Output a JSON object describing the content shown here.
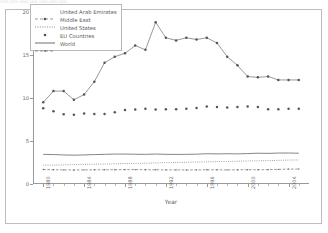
{
  "figure": {
    "ghost_text": "      1970      1975      1980      1985      1990      1995      2000"
  },
  "axes": {
    "xlabel": "Year",
    "ylabel": "Energy Consumption (TOE/Capita)",
    "yticks": [
      "0",
      "5",
      "10",
      "15",
      "20"
    ],
    "xticks": [
      "1980",
      "1984",
      "1988",
      "1992",
      "1996",
      "2000",
      "2004",
      "2008"
    ]
  },
  "legend": {
    "items": [
      {
        "label": "United Arab Emirates",
        "style": "line-marker",
        "color": "#555555"
      },
      {
        "label": "Middle East",
        "style": "dotted",
        "color": "#6b6b6b"
      },
      {
        "label": "United States",
        "style": "marker",
        "color": "#555555"
      },
      {
        "label": "EU Countries",
        "style": "solid",
        "color": "#6f6f6f"
      },
      {
        "label": "World",
        "style": "dashed-marker",
        "color": "#6b6b6b"
      }
    ]
  },
  "chart_data": {
    "type": "line",
    "title": "",
    "xlabel": "Year",
    "ylabel": "Energy Consumption (TOE/Capita)",
    "xlim": [
      1979,
      2006
    ],
    "ylim": [
      0,
      20
    ],
    "yticks": [
      0,
      5,
      10,
      15,
      20
    ],
    "xticks": [
      1980,
      1984,
      1988,
      1992,
      1996,
      2000,
      2004,
      2008
    ],
    "grid": false,
    "legend_position": "upper left",
    "x": [
      1980,
      1981,
      1982,
      1983,
      1984,
      1985,
      1986,
      1987,
      1988,
      1989,
      1990,
      1991,
      1992,
      1993,
      1994,
      1995,
      1996,
      1997,
      1998,
      1999,
      2000,
      2001,
      2002,
      2003,
      2004,
      2005
    ],
    "series": [
      {
        "name": "United Arab Emirates",
        "style": "line-marker",
        "color": "#555555",
        "values": [
          9.5,
          10.8,
          10.8,
          9.8,
          10.4,
          11.9,
          14.1,
          14.8,
          15.2,
          16.1,
          15.6,
          18.8,
          17.0,
          16.7,
          17.0,
          16.8,
          17.0,
          16.4,
          14.8,
          13.8,
          12.5,
          12.4,
          12.5,
          12.1,
          12.1,
          12.1
        ]
      },
      {
        "name": "Middle East",
        "style": "dotted",
        "color": "#6b6b6b",
        "values": [
          2.18,
          2.2,
          2.22,
          2.25,
          2.28,
          2.3,
          2.32,
          2.35,
          2.38,
          2.4,
          2.42,
          2.45,
          2.48,
          2.5,
          2.52,
          2.55,
          2.58,
          2.6,
          2.62,
          2.65,
          2.68,
          2.7,
          2.72,
          2.75,
          2.78,
          2.8
        ]
      },
      {
        "name": "United States",
        "style": "marker",
        "color": "#555555",
        "values": [
          8.8,
          8.45,
          8.1,
          8.05,
          8.2,
          8.15,
          8.15,
          8.35,
          8.6,
          8.65,
          8.75,
          8.65,
          8.7,
          8.7,
          8.75,
          8.85,
          9.0,
          8.95,
          8.9,
          8.95,
          9.0,
          8.95,
          8.7,
          8.7,
          8.75,
          8.75
        ]
      },
      {
        "name": "EU Countries",
        "style": "solid",
        "color": "#6f6f6f",
        "values": [
          3.45,
          3.42,
          3.38,
          3.35,
          3.38,
          3.42,
          3.45,
          3.48,
          3.48,
          3.46,
          3.45,
          3.48,
          3.45,
          3.44,
          3.45,
          3.47,
          3.52,
          3.5,
          3.52,
          3.5,
          3.54,
          3.58,
          3.56,
          3.6,
          3.6,
          3.58
        ]
      },
      {
        "name": "World",
        "style": "dashed-marker",
        "color": "#6b6b6b",
        "values": [
          1.68,
          1.66,
          1.64,
          1.63,
          1.64,
          1.65,
          1.65,
          1.66,
          1.67,
          1.67,
          1.66,
          1.65,
          1.64,
          1.64,
          1.63,
          1.64,
          1.65,
          1.65,
          1.64,
          1.65,
          1.66,
          1.66,
          1.67,
          1.7,
          1.73,
          1.74
        ]
      }
    ]
  }
}
